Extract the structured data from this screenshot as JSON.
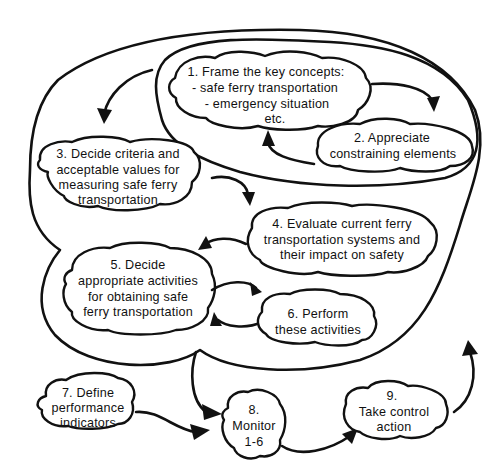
{
  "diagram": {
    "type": "process-loop-diagram",
    "colors": {
      "ink": "#111111",
      "background": "#ffffff"
    },
    "nodes": [
      {
        "id": "1",
        "lines": [
          "1.  Frame the key concepts:",
          "- safe ferry transportation",
          "- emergency situation",
          "etc."
        ]
      },
      {
        "id": "2",
        "lines": [
          "2.  Appreciate",
          "constraining elements"
        ]
      },
      {
        "id": "3",
        "lines": [
          "3.  Decide criteria and",
          "acceptable values for",
          "measuring safe ferry",
          "transportation"
        ]
      },
      {
        "id": "4",
        "lines": [
          "4.  Evaluate current ferry",
          "transportation systems and",
          "their impact on safety"
        ]
      },
      {
        "id": "5",
        "lines": [
          "5.  Decide",
          "appropriate activities",
          "for obtaining safe",
          "ferry transportation"
        ]
      },
      {
        "id": "6",
        "lines": [
          "6. Perform",
          "these activities"
        ]
      },
      {
        "id": "7",
        "lines": [
          "7.  Define",
          "performance",
          "indicators"
        ]
      },
      {
        "id": "8",
        "lines": [
          "8.",
          "Monitor",
          "1-6"
        ]
      },
      {
        "id": "9",
        "lines": [
          "9.",
          "Take control",
          "action"
        ]
      }
    ],
    "edges": [
      {
        "from": "1",
        "to": "2"
      },
      {
        "from": "2",
        "to": "1"
      },
      {
        "from": "1",
        "to": "3"
      },
      {
        "from": "3",
        "to": "4"
      },
      {
        "from": "4",
        "to": "5"
      },
      {
        "from": "5",
        "to": "6"
      },
      {
        "from": "6",
        "to": "5"
      },
      {
        "from": "1-6",
        "to": "8"
      },
      {
        "from": "7",
        "to": "8"
      },
      {
        "from": "8",
        "to": "9"
      },
      {
        "from": "9",
        "to": "1-6"
      }
    ],
    "groups": [
      {
        "id": "inner-loop",
        "contains": [
          "1",
          "2"
        ]
      },
      {
        "id": "outer-loop",
        "contains": [
          "1",
          "2",
          "3",
          "4",
          "5",
          "6"
        ]
      }
    ]
  }
}
